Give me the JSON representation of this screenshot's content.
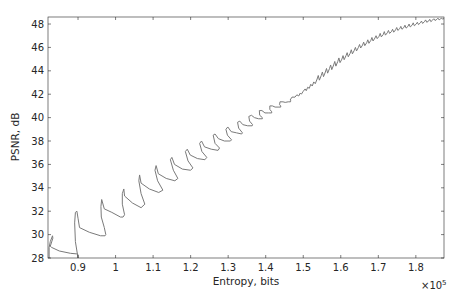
{
  "chart_data": {
    "type": "line",
    "title": "",
    "xlabel": "Entropy, bits",
    "ylabel": "PSNR, dB",
    "x_multiplier_label": "×10",
    "x_multiplier_exponent": "5",
    "xlim": [
      0.82,
      1.875
    ],
    "ylim": [
      28,
      48.6
    ],
    "x_scale": 100000,
    "xticks": [
      0.9,
      1.0,
      1.1,
      1.2,
      1.3,
      1.4,
      1.5,
      1.6,
      1.7,
      1.8
    ],
    "xtick_labels": [
      "0.9",
      "1",
      "1.1",
      "1.2",
      "1.3",
      "1.4",
      "1.5",
      "1.6",
      "1.7",
      "1.8"
    ],
    "yticks": [
      28,
      30,
      32,
      34,
      36,
      38,
      40,
      42,
      44,
      46,
      48
    ],
    "ytick_labels": [
      "28",
      "30",
      "32",
      "34",
      "36",
      "38",
      "40",
      "42",
      "44",
      "46",
      "48"
    ],
    "grid": false,
    "legend": null,
    "line_color": "#7a7a7a",
    "series": [
      {
        "name": "PSNR vs Entropy",
        "x": [
          0.823,
          0.823,
          0.826,
          0.832,
          0.833,
          0.826,
          0.83,
          0.85,
          0.88,
          0.897,
          0.9,
          0.9,
          0.897,
          0.893,
          0.891,
          0.893,
          0.897,
          0.9,
          0.904,
          0.93,
          0.96,
          0.972,
          0.974,
          0.97,
          0.962,
          0.961,
          0.963,
          0.97,
          0.99,
          1.013,
          1.02,
          1.024,
          1.018,
          1.018,
          1.022,
          1.024,
          1.045,
          1.068,
          1.078,
          1.068,
          1.062,
          1.064,
          1.068,
          1.09,
          1.115,
          1.126,
          1.112,
          1.105,
          1.108,
          1.114,
          1.135,
          1.158,
          1.166,
          1.154,
          1.146,
          1.15,
          1.157,
          1.178,
          1.2,
          1.206,
          1.193,
          1.186,
          1.191,
          1.199,
          1.218,
          1.238,
          1.243,
          1.23,
          1.224,
          1.229,
          1.237,
          1.255,
          1.273,
          1.277,
          1.265,
          1.26,
          1.265,
          1.274,
          1.29,
          1.306,
          1.309,
          1.298,
          1.294,
          1.299,
          1.308,
          1.322,
          1.336,
          1.338,
          1.328,
          1.325,
          1.331,
          1.339,
          1.352,
          1.364,
          1.365,
          1.357,
          1.355,
          1.362,
          1.37,
          1.381,
          1.391,
          1.391,
          1.384,
          1.383,
          1.39,
          1.398,
          1.408,
          1.416,
          1.416,
          1.411,
          1.411,
          1.418,
          1.425,
          1.433,
          1.44,
          1.44,
          1.437,
          1.438,
          1.446,
          1.452,
          1.46,
          1.466,
          1.467,
          1.465,
          1.47,
          1.478,
          1.483,
          1.488,
          1.492,
          1.495,
          1.5,
          1.505,
          1.508,
          1.512,
          1.516,
          1.52,
          1.524,
          1.528,
          1.532,
          1.537,
          1.54,
          1.543,
          1.548,
          1.551,
          1.554,
          1.559,
          1.562,
          1.565,
          1.57,
          1.573,
          1.576,
          1.581,
          1.584,
          1.587,
          1.592,
          1.595,
          1.598,
          1.603,
          1.606,
          1.609,
          1.614,
          1.617,
          1.62,
          1.625,
          1.628,
          1.631,
          1.636,
          1.639,
          1.642,
          1.647,
          1.65,
          1.653,
          1.658,
          1.661,
          1.664,
          1.669,
          1.672,
          1.675,
          1.68,
          1.683,
          1.686,
          1.691,
          1.694,
          1.697,
          1.702,
          1.705,
          1.708,
          1.713,
          1.716,
          1.719,
          1.724,
          1.727,
          1.73,
          1.735,
          1.738,
          1.741,
          1.746,
          1.749,
          1.752,
          1.757,
          1.76,
          1.763,
          1.768,
          1.771,
          1.774,
          1.779,
          1.782,
          1.785,
          1.79,
          1.793,
          1.796,
          1.801,
          1.804,
          1.807,
          1.812,
          1.815,
          1.818,
          1.823,
          1.826,
          1.829,
          1.834,
          1.837,
          1.84,
          1.845,
          1.848,
          1.851,
          1.856,
          1.859,
          1.862,
          1.866,
          1.869,
          1.872,
          1.874
        ],
        "y": [
          28.0,
          28.9,
          29.4,
          29.9,
          29.7,
          29.0,
          28.9,
          28.6,
          28.4,
          28.35,
          28.3,
          28.0,
          28.6,
          29.4,
          31.0,
          31.9,
          32.0,
          31.4,
          30.6,
          30.2,
          29.9,
          29.9,
          30.0,
          30.6,
          31.5,
          32.4,
          33.0,
          32.2,
          31.9,
          31.5,
          31.5,
          31.7,
          32.6,
          33.5,
          33.9,
          33.3,
          32.7,
          32.3,
          32.6,
          33.5,
          34.6,
          35.1,
          34.4,
          33.9,
          33.6,
          33.8,
          34.6,
          35.5,
          35.9,
          35.2,
          34.8,
          34.6,
          34.8,
          35.5,
          36.4,
          36.6,
          36.0,
          35.6,
          35.5,
          35.7,
          36.3,
          37.1,
          37.3,
          36.8,
          36.5,
          36.4,
          36.6,
          37.1,
          37.8,
          38.0,
          37.5,
          37.3,
          37.2,
          37.4,
          37.8,
          38.5,
          38.6,
          38.2,
          38.0,
          38.0,
          38.1,
          38.5,
          39.0,
          39.2,
          38.8,
          38.7,
          38.6,
          38.7,
          39.1,
          39.6,
          39.7,
          39.4,
          39.3,
          39.3,
          39.4,
          39.7,
          40.1,
          40.2,
          40.0,
          39.9,
          39.9,
          40.0,
          40.2,
          40.6,
          40.6,
          40.4,
          40.4,
          40.4,
          40.5,
          40.7,
          41.0,
          41.0,
          40.9,
          40.9,
          40.9,
          41.0,
          41.1,
          41.35,
          41.35,
          41.3,
          41.35,
          41.35,
          41.45,
          41.5,
          41.75,
          41.75,
          41.95,
          41.85,
          42.1,
          42.0,
          42.25,
          42.45,
          42.3,
          42.6,
          42.5,
          42.85,
          42.7,
          43.05,
          42.9,
          43.3,
          43.6,
          43.2,
          43.6,
          43.9,
          43.5,
          43.9,
          44.2,
          43.8,
          44.2,
          44.5,
          44.1,
          44.5,
          44.8,
          44.4,
          44.8,
          45.1,
          44.7,
          45.0,
          45.3,
          44.95,
          45.3,
          45.55,
          45.2,
          45.5,
          45.8,
          45.45,
          45.75,
          46.0,
          45.7,
          46.0,
          46.25,
          45.95,
          46.2,
          46.45,
          46.15,
          46.4,
          46.65,
          46.35,
          46.6,
          46.85,
          46.55,
          46.8,
          47.0,
          46.75,
          46.95,
          47.2,
          46.9,
          47.1,
          47.35,
          47.05,
          47.25,
          47.45,
          47.2,
          47.35,
          47.55,
          47.3,
          47.5,
          47.7,
          47.45,
          47.6,
          47.8,
          47.55,
          47.7,
          47.9,
          47.65,
          47.8,
          48.0,
          47.75,
          47.9,
          48.1,
          47.85,
          48.0,
          48.15,
          47.95,
          48.1,
          48.25,
          48.05,
          48.2,
          48.35,
          48.15,
          48.25,
          48.4,
          48.2,
          48.35,
          48.45,
          48.3,
          48.4,
          48.5,
          48.35,
          48.45,
          48.5,
          48.4,
          48.5
        ]
      }
    ]
  }
}
